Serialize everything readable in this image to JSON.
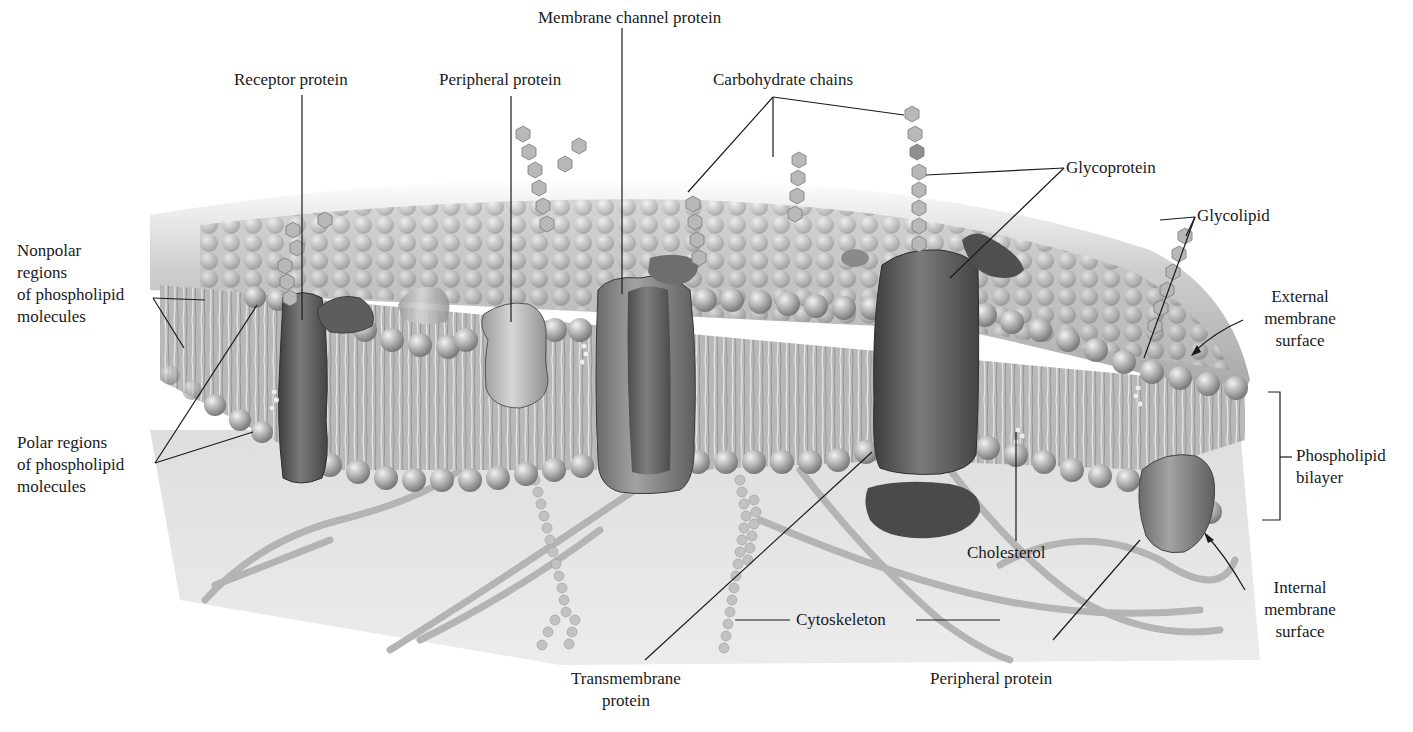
{
  "figure": {
    "labels": {
      "membrane_channel_protein": "Membrane channel protein",
      "receptor_protein": "Receptor protein",
      "peripheral_protein_top": "Peripheral protein",
      "carbohydrate_chains": "Carbohydrate chains",
      "glycoprotein": "Glycoprotein",
      "glycolipid": "Glycolipid",
      "nonpolar_regions": [
        "Nonpolar",
        "regions",
        "of phospholipid",
        "molecules"
      ],
      "polar_regions": [
        "Polar regions",
        "of phospholipid",
        "molecules"
      ],
      "external_membrane_surface": [
        "External",
        "membrane",
        "surface"
      ],
      "phospholipid_bilayer": [
        "Phospholipid",
        "bilayer"
      ],
      "internal_membrane_surface": [
        "Internal",
        "membrane",
        "surface"
      ],
      "cholesterol": "Cholesterol",
      "cytoskeleton": "Cytoskeleton",
      "transmembrane_protein": [
        "Transmembrane",
        "protein"
      ],
      "peripheral_protein_bottom": "Peripheral protein"
    },
    "colors": {
      "background": "#ffffff",
      "membrane_shade": "#b5b5b5",
      "protein_dark": "#5a5a5a",
      "protein_light": "#a8a8a8",
      "cytoplasm": "#e6e6e6",
      "leader_line": "#1a1a1a"
    }
  }
}
